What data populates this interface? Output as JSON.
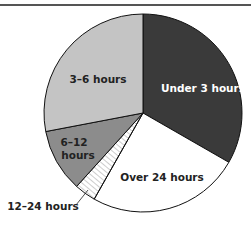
{
  "chart_data": {
    "type": "pie",
    "title": "",
    "slices": [
      {
        "label": "Under 3 hours",
        "value": 33.3,
        "color": "#3a3a3a",
        "text_color": "#ffffff"
      },
      {
        "label": "Over 24 hours",
        "value": 24.9,
        "color": "#ffffff",
        "text_color": "#222222"
      },
      {
        "label": "12–24 hours",
        "value": 3.5,
        "color": "#ffffff",
        "pattern": "hatch",
        "text_color": "#222222"
      },
      {
        "label": "6–12 hours",
        "value": 10.3,
        "color": "#8c8c8c",
        "text_color": "#222222"
      },
      {
        "label": "3–6 hours",
        "value": 28.0,
        "color": "#c4c4c4",
        "text_color": "#222222"
      }
    ],
    "start_angle_deg": 0,
    "direction": "clockwise"
  },
  "labels": {
    "under3": "Under 3 hours",
    "over24": "Over 24 hours",
    "h12_24": "12–24 hours",
    "h6_12_line1": "6–12",
    "h6_12_line2": "hours",
    "h3_6": "3–6 hours"
  }
}
